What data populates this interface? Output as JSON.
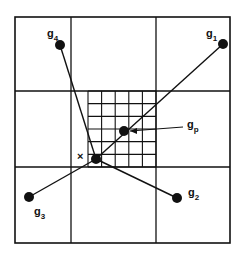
{
  "diagram": {
    "title": "",
    "outer_box": {
      "x": 15,
      "y": 17,
      "w": 215,
      "h": 226
    },
    "coarse_grid": {
      "cols": 2,
      "rows": 2,
      "vx": [
        88,
        161
      ],
      "hy": [
        91,
        167
      ]
    },
    "fine_grid": {
      "x0": 88,
      "x1": 161,
      "y0": 91,
      "y1": 167,
      "vx": [
        88,
        102,
        116,
        130,
        145,
        161
      ],
      "hy": [
        91,
        106,
        120,
        134,
        148,
        160,
        167
      ]
    },
    "nodes": [
      {
        "id": "g1",
        "label": "g",
        "sub": "1",
        "x": 223,
        "y": 44,
        "lx": 206,
        "ly": 37
      },
      {
        "id": "g2",
        "label": "g",
        "sub": "2",
        "x": 177,
        "y": 198,
        "lx": 188,
        "ly": 196
      },
      {
        "id": "g3",
        "label": "g",
        "sub": "3",
        "x": 29,
        "y": 197,
        "lx": 34,
        "ly": 215
      },
      {
        "id": "g4",
        "label": "g",
        "sub": "4",
        "x": 60,
        "y": 45,
        "lx": 47,
        "ly": 37
      },
      {
        "id": "gp",
        "label": "g",
        "sub": "p",
        "x": 124,
        "y": 131,
        "lx": 187,
        "ly": 128
      },
      {
        "id": "x",
        "label": "",
        "sub": "",
        "x": 96,
        "y": 159,
        "lx": 0,
        "ly": 0
      }
    ],
    "x_marker": {
      "label": "×",
      "x": 77,
      "y": 160
    },
    "edges": [
      {
        "from": "x",
        "to": "g1"
      },
      {
        "from": "x",
        "to": "g2"
      },
      {
        "from": "x",
        "to": "g3"
      },
      {
        "from": "x",
        "to": "g4"
      }
    ],
    "arrow": {
      "from_x": 183,
      "from_y": 127,
      "to_x": 130,
      "to_y": 131
    }
  }
}
